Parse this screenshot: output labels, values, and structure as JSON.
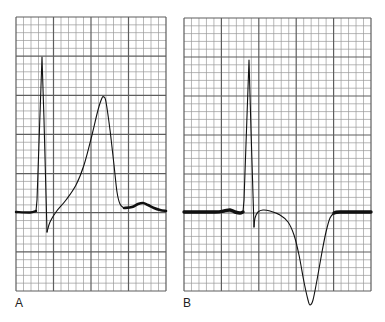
{
  "figure": {
    "background": "#ffffff",
    "grid": {
      "minor_color": "#9a9a9a",
      "major_color": "#5e5e5e",
      "minor_per_major": 5
    },
    "trace_color": "#111111",
    "panels": [
      {
        "id": "A",
        "label": "A",
        "label_pos": [
          15,
          308
        ],
        "grid_box": {
          "x": 16,
          "y": 17,
          "width": 150,
          "height": 274,
          "major_cols": 4,
          "major_rows": 7
        },
        "waveform_description": "Tall narrow QRS followed by markedly elevated ST segment merging into a tall peaked T wave; small U wave after",
        "segments": [
          {
            "name": "baseline-pre",
            "width": 2.4,
            "points": [
              [
                16,
                212
              ],
              [
                30,
                212.5
              ],
              [
                36,
                211
              ]
            ]
          },
          {
            "name": "qrs",
            "width": 1.1,
            "points": [
              [
                36,
                211
              ],
              [
                37,
                200
              ],
              [
                42,
                57
              ],
              [
                44,
                120
              ],
              [
                47,
                232
              ]
            ]
          },
          {
            "name": "st-t",
            "width": 1.1,
            "points": [
              [
                47,
                232
              ],
              [
                50,
                222
              ],
              [
                56,
                212
              ],
              [
                66,
                200
              ],
              [
                76,
                185
              ],
              [
                84,
                165
              ],
              [
                92,
                135
              ],
              [
                98,
                110
              ],
              [
                102,
                98
              ],
              [
                104,
                97
              ],
              [
                106,
                102
              ],
              [
                110,
                130
              ],
              [
                114,
                165
              ],
              [
                117,
                192
              ],
              [
                120,
                204
              ],
              [
                124,
                208
              ]
            ]
          },
          {
            "name": "baseline-post",
            "width": 2.6,
            "points": [
              [
                124,
                208
              ],
              [
                132,
                207
              ],
              [
                138,
                204
              ],
              [
                143,
                203
              ],
              [
                148,
                205
              ],
              [
                154,
                208
              ],
              [
                160,
                210
              ],
              [
                166,
                211
              ]
            ]
          }
        ]
      },
      {
        "id": "B",
        "label": "B",
        "label_pos": [
          183,
          308
        ],
        "grid_box": {
          "x": 184,
          "y": 18,
          "width": 187,
          "height": 273,
          "major_cols": 5,
          "major_rows": 7
        },
        "waveform_description": "Tall narrow QRS followed by deeply inverted, symmetric T wave",
        "segments": [
          {
            "name": "baseline-pre",
            "width": 3.4,
            "points": [
              [
                184,
                212
              ],
              [
                215,
                212
              ],
              [
                224,
                211
              ],
              [
                230,
                210
              ],
              [
                235,
                212
              ],
              [
                240,
                213
              ],
              [
                243,
                212
              ]
            ]
          },
          {
            "name": "qrs",
            "width": 1.1,
            "points": [
              [
                243,
                212
              ],
              [
                244,
                200
              ],
              [
                249,
                60
              ],
              [
                251,
                130
              ],
              [
                254,
                227
              ]
            ]
          },
          {
            "name": "st-t",
            "width": 1.1,
            "points": [
              [
                254,
                227
              ],
              [
                255,
                218
              ],
              [
                258,
                212
              ],
              [
                263,
                210
              ],
              [
                270,
                211
              ],
              [
                280,
                215
              ],
              [
                288,
                222
              ],
              [
                294,
                235
              ],
              [
                299,
                255
              ],
              [
                304,
                282
              ],
              [
                308,
                300
              ],
              [
                310,
                305
              ],
              [
                313,
                300
              ],
              [
                317,
                280
              ],
              [
                322,
                252
              ],
              [
                326,
                232
              ],
              [
                330,
                218
              ],
              [
                334,
                213
              ]
            ]
          },
          {
            "name": "baseline-post",
            "width": 3.4,
            "points": [
              [
                334,
                213
              ],
              [
                340,
                212
              ],
              [
                371,
                212
              ]
            ]
          }
        ]
      }
    ]
  }
}
